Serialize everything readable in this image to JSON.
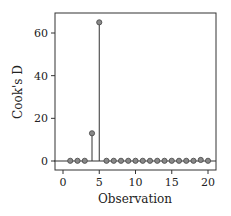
{
  "chart_data": {
    "type": "scatter",
    "subtype": "stem",
    "title": "",
    "xlabel": "Observation",
    "ylabel": "Cook's D",
    "xlim": [
      -1,
      21
    ],
    "ylim": [
      -3,
      70
    ],
    "xticks": [
      0,
      5,
      10,
      15,
      20
    ],
    "yticks": [
      0,
      20,
      40,
      60
    ],
    "grid": false,
    "legend": null,
    "reference_line_y": 0,
    "x": [
      1,
      2,
      3,
      4,
      5,
      6,
      7,
      8,
      9,
      10,
      11,
      12,
      13,
      14,
      15,
      16,
      17,
      18,
      19,
      20
    ],
    "values": [
      0.1,
      0.1,
      0.1,
      13,
      65,
      0.1,
      0.1,
      0.1,
      0.1,
      0.1,
      0.1,
      0.1,
      0.1,
      0.1,
      0.1,
      0.1,
      0.1,
      0.1,
      0.5,
      0.1
    ]
  },
  "colors": {
    "marker": "#888888",
    "line": "#333333"
  }
}
